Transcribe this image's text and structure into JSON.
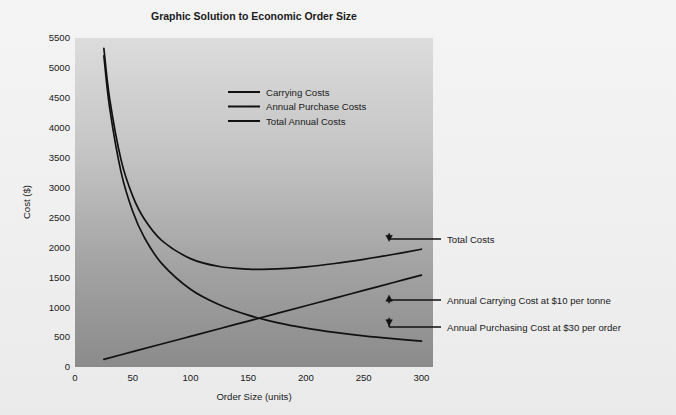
{
  "figure": {
    "background_color": "#f0f0f0",
    "plot_gradient_top": "#d9d9d9",
    "plot_gradient_bottom": "#8c8c8c",
    "line_color": "#111111"
  },
  "chart_data": {
    "type": "line",
    "title": "Graphic Solution to Economic Order Size",
    "xlabel": "Order Size (units)",
    "ylabel": "Cost ($)",
    "xlim": [
      0,
      310
    ],
    "ylim": [
      0,
      5500
    ],
    "xticks": [
      0,
      50,
      100,
      150,
      200,
      250,
      300
    ],
    "yticks": [
      0,
      500,
      1000,
      1500,
      2000,
      2500,
      3000,
      3500,
      4000,
      4500,
      5000,
      5500
    ],
    "xtick_labels": [
      "0",
      "50",
      "100",
      "150",
      "200",
      "250",
      "300"
    ],
    "ytick_labels": [
      "0",
      "500",
      "1000",
      "1500",
      "2000",
      "2500",
      "3000",
      "3500",
      "4000",
      "4500",
      "5000",
      "5500"
    ],
    "grid": false,
    "legend_position": "upper center",
    "legend": [
      "Carrying Costs",
      "Annual Purchase Costs",
      "Total Annual Costs"
    ],
    "series": [
      {
        "name": "Carrying Costs",
        "note": "Annual carrying cost = $10 per tonne; linear in order size",
        "x": [
          25,
          50,
          75,
          100,
          125,
          150,
          175,
          200,
          225,
          250,
          275,
          300
        ],
        "values": [
          128,
          256,
          384,
          512,
          640,
          768,
          896,
          1024,
          1152,
          1280,
          1408,
          1536
        ]
      },
      {
        "name": "Annual Purchase Costs",
        "note": "Annual purchasing cost = $30 per order; hyperbolic in order size",
        "x": [
          25,
          30,
          40,
          50,
          60,
          75,
          100,
          125,
          150,
          175,
          200,
          225,
          250,
          275,
          300
        ],
        "values": [
          5200,
          4333,
          3250,
          2600,
          2167,
          1733,
          1300,
          1040,
          867,
          743,
          650,
          578,
          520,
          473,
          433
        ]
      },
      {
        "name": "Total Annual Costs",
        "note": "Sum of carrying and purchasing costs; minimum near order size 160",
        "x": [
          25,
          30,
          40,
          50,
          60,
          75,
          100,
          125,
          150,
          160,
          175,
          200,
          225,
          250,
          275,
          300
        ],
        "values": [
          5328,
          4487,
          3455,
          2856,
          2474,
          2117,
          1812,
          1680,
          1635,
          1632,
          1639,
          1674,
          1730,
          1800,
          1881,
          1969
        ]
      }
    ],
    "annotations": [
      {
        "label": "Total Costs",
        "points_to_series": "Total Annual Costs",
        "at_x": 272,
        "at_y": 1900
      },
      {
        "label": "Annual Carrying Cost at $10 per tonne",
        "points_to_series": "Carrying Costs",
        "at_x": 272,
        "at_y": 1400
      },
      {
        "label": "Annual Purchasing Cost at $30 per order",
        "points_to_series": "Annual Purchase Costs",
        "at_x": 272,
        "at_y": 490
      }
    ]
  }
}
